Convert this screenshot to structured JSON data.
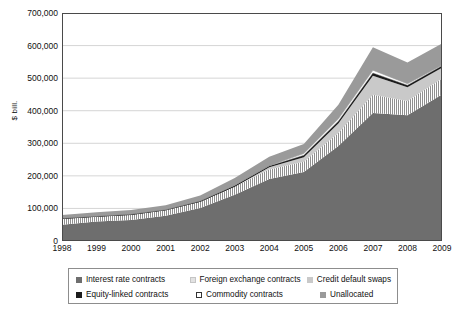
{
  "chart_data": {
    "type": "area",
    "stacked": true,
    "title": "",
    "xlabel": "",
    "ylabel": "$ bill.",
    "x": [
      1998,
      1999,
      2000,
      2001,
      2002,
      2003,
      2004,
      2005,
      2006,
      2007,
      2008,
      2009
    ],
    "xtick_labels": [
      "1998",
      "1999",
      "2000",
      "2001",
      "2002",
      "2003",
      "2004",
      "2005",
      "2006",
      "2007",
      "2008",
      "2009"
    ],
    "ylim": [
      0,
      700000
    ],
    "ytick_values": [
      0,
      100000,
      200000,
      300000,
      400000,
      500000,
      600000,
      700000
    ],
    "ytick_labels": [
      "0",
      "100,000",
      "200,000",
      "300,000",
      "400,000",
      "500,000",
      "600,000",
      "700,000"
    ],
    "grid": "horizontal",
    "legend_position": "below-axis",
    "series": [
      {
        "name": "Interest rate contracts",
        "color": "#6e6e6e",
        "values": [
          50015,
          60091,
          64668,
          77568,
          101658,
          141991,
          190502,
          211970,
          291582,
          393138,
          385896,
          449875
        ]
      },
      {
        "name": "Foreign exchange contracts",
        "color": "#d8d8d8",
        "pattern": "vertical-hatch",
        "values": [
          18011,
          14344,
          15666,
          16748,
          18469,
          24484,
          29289,
          31360,
          40271,
          56238,
          44200,
          49181
        ]
      },
      {
        "name": "Credit default swaps",
        "color": "#c9c9c9",
        "values": [
          0,
          0,
          0,
          0,
          0,
          0,
          6396,
          13908,
          28650,
          57894,
          41883,
          32693
        ]
      },
      {
        "name": "Equity-linked contracts",
        "color": "#1c1c1c",
        "values": [
          1488,
          1809,
          1891,
          1881,
          2309,
          3787,
          4385,
          5793,
          7488,
          8469,
          6471,
          5937
        ]
      },
      {
        "name": "Commodity contracts",
        "color": "#ffffff",
        "values": [
          415,
          548,
          662,
          598,
          923,
          1406,
          1443,
          5434,
          7115,
          8455,
          4427,
          2944
        ]
      },
      {
        "name": "Unallocated",
        "color": "#9a9a9a",
        "values": [
          10000,
          11500,
          12500,
          13000,
          16000,
          22000,
          27000,
          29000,
          43000,
          71000,
          65000,
          66000
        ]
      }
    ],
    "totals": [
      79929,
      88292,
      95387,
      109795,
      139359,
      193668,
      259015,
      297465,
      418106,
      595194,
      547877,
      606630
    ],
    "legend_entries": [
      "Interest rate contracts",
      "Foreign exchange contracts",
      "Credit default swaps",
      "Equity-linked contracts",
      "Commodity contracts",
      "Unallocated"
    ]
  }
}
